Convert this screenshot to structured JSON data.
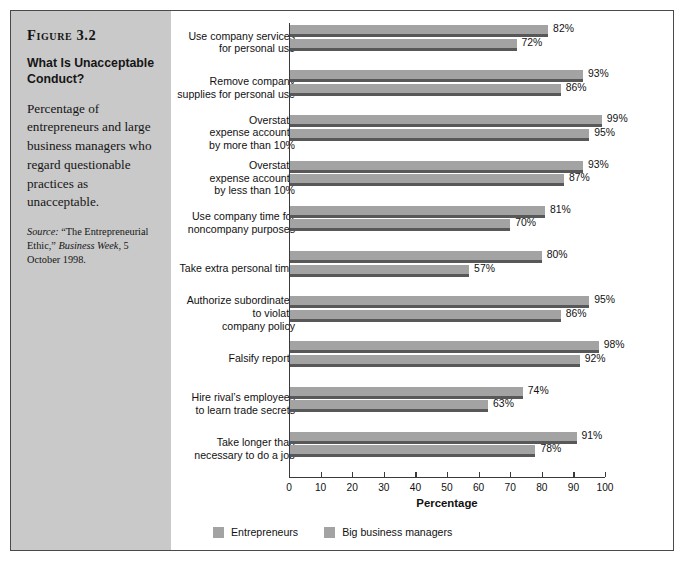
{
  "figure": {
    "number": "Figure 3.2",
    "title": "What Is Unacceptable Conduct?",
    "description": "Percentage of entrepreneurs and large business managers who regard questionable practices as unacceptable.",
    "source_label": "Source:",
    "source_text_1": " “The Entrepreneurial Ethic,” ",
    "source_italic": "Business Week",
    "source_text_2": ", 5 October 1998."
  },
  "legend": {
    "items": [
      {
        "label": "Entrepreneurs",
        "color": "#a3a3a3"
      },
      {
        "label": "Big business managers",
        "color": "#a3a3a3"
      }
    ]
  },
  "chart_data": {
    "type": "bar",
    "orientation": "horizontal",
    "title": "What Is Unacceptable Conduct?",
    "xlabel": "Percentage",
    "ylabel": "",
    "xlim": [
      0,
      100
    ],
    "xticks": [
      0,
      10,
      20,
      30,
      40,
      50,
      60,
      70,
      80,
      90,
      100
    ],
    "grid": false,
    "legend_position": "bottom-left",
    "categories": [
      "Use company services\nfor personal use",
      "Remove company\nsupplies for personal use",
      "Overstate\nexpense accounts\nby more than 10%",
      "Overstate\nexpense accounts\nby less than 10%",
      "Use company time for\nnoncompany purposes",
      "Take extra personal time",
      "Authorize subordinates\nto violate\ncompany policy",
      "Falsify reports",
      "Hire rival’s employees\nto learn trade secrets",
      "Take longer than\nnecessary to do a job"
    ],
    "series": [
      {
        "name": "Entrepreneurs",
        "values": [
          82,
          93,
          99,
          93,
          81,
          80,
          95,
          98,
          74,
          91
        ],
        "labels": [
          "82%",
          "93%",
          "99%",
          "93%",
          "81%",
          "80%",
          "95%",
          "98%",
          "74%",
          "91%"
        ]
      },
      {
        "name": "Big business managers",
        "values": [
          72,
          86,
          95,
          87,
          70,
          57,
          86,
          92,
          63,
          78
        ],
        "labels": [
          "72%",
          "86%",
          "95%",
          "87%",
          "70%",
          "57%",
          "86%",
          "92%",
          "63%",
          "78%"
        ]
      }
    ]
  }
}
